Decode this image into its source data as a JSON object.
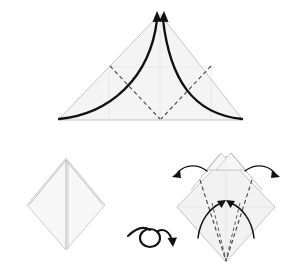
{
  "figure": {
    "title": "Origami folding sequence",
    "background_color": "#ffffff",
    "panel_count": 3,
    "step_labels": []
  },
  "palette": {
    "paper_fill": "#f4f4f4",
    "paper_edge": "#bfbfbf",
    "fold_dashed": "#4a4a4a",
    "bold_fold": "#111111",
    "arrow": "#111111",
    "faint_crease": "#e3e3e3"
  },
  "panels": [
    {
      "id": "panel-top-triangle",
      "name": "Triangle with curved fold arrows",
      "shape": "triangle",
      "apex": [
        160,
        14
      ],
      "base_left": [
        58,
        120
      ],
      "base_right": [
        243,
        120
      ],
      "fill": "#f4f4f4",
      "elements": {
        "faint_grid_lines": 4,
        "dashed_fold_lines": 2,
        "bold_curved_folds": 2,
        "arrowheads": 2
      },
      "instruction": "Fold both lower corners up to the top point"
    },
    {
      "id": "panel-bottom-left-diamond",
      "name": "Folded diamond result",
      "shape": "diamond",
      "top": [
        66,
        158
      ],
      "left": [
        27,
        205
      ],
      "bottom": [
        66,
        250
      ],
      "right": [
        105,
        205
      ],
      "fill": "#f7f7f7",
      "elements": {
        "center_crease": 1,
        "layer_edges": 2
      },
      "instruction": "Result after folding"
    },
    {
      "id": "panel-flip-symbol",
      "name": "Turn over symbol",
      "shape": "loop-arrow",
      "center": [
        152,
        240
      ],
      "instruction": "Turn the model over"
    },
    {
      "id": "panel-bottom-right-diamond",
      "name": "Diamond with valley folds and arrows",
      "shape": "diamond",
      "top": [
        226,
        153
      ],
      "left": [
        177,
        207
      ],
      "bottom": [
        226,
        262
      ],
      "right": [
        275,
        207
      ],
      "fill": "#f4f4f4",
      "elements": {
        "split_apex_flaps": 2,
        "dashed_fold_lines": 4,
        "inward_arrows": 2,
        "outward_arrows": 2
      },
      "instruction": "Fold lower edges to center; swing flaps outward"
    }
  ],
  "annotations": {
    "arrow_directions": [
      "up-to-apex-left",
      "up-to-apex-right",
      "inward-center-left",
      "inward-center-right",
      "outward-upper-left",
      "outward-upper-right"
    ],
    "fold_types": [
      "valley",
      "mountain"
    ]
  }
}
